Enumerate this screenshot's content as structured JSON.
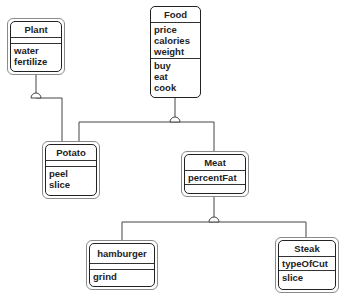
{
  "diagram": {
    "type": "UML class diagram",
    "classes": {
      "plant": {
        "name": "Plant",
        "attributes": [],
        "operations": [
          "water",
          "fertilize"
        ]
      },
      "food": {
        "name": "Food",
        "attributes": [
          "price",
          "calories",
          "weight"
        ],
        "operations": [
          "buy",
          "eat",
          "cook"
        ]
      },
      "potato": {
        "name": "Potato",
        "attributes": [],
        "operations": [
          "peel",
          "slice"
        ]
      },
      "meat": {
        "name": "Meat",
        "attributes": [
          "percentFat"
        ],
        "operations": []
      },
      "hamburger": {
        "name": "hamburger",
        "attributes": [],
        "operations": [
          "grind"
        ]
      },
      "steak": {
        "name": "Steak",
        "attributes": [
          "typeOfCut"
        ],
        "operations": [
          "slice"
        ]
      }
    },
    "relationships": [
      {
        "type": "generalization",
        "parent": "Plant",
        "children": [
          "Potato"
        ]
      },
      {
        "type": "generalization",
        "parent": "Food",
        "children": [
          "Potato",
          "Meat"
        ]
      },
      {
        "type": "generalization",
        "parent": "Meat",
        "children": [
          "hamburger",
          "Steak"
        ]
      }
    ],
    "colors": {
      "line": "#333333",
      "border": "#222222",
      "outer_border": "#8a8a8a",
      "background": "#ffffff"
    }
  }
}
